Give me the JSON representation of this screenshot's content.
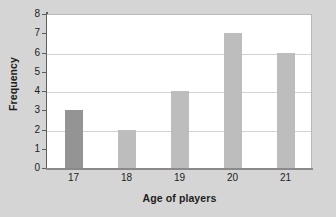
{
  "chart_data": {
    "type": "bar",
    "title": "",
    "subtitle": "",
    "categories": [
      "17",
      "18",
      "19",
      "20",
      "21"
    ],
    "values": [
      3,
      2,
      4,
      7,
      6
    ],
    "xlabel": "Age of players",
    "ylabel": "Frequency",
    "ylim": [
      0,
      8
    ],
    "y_ticks": [
      "0",
      "1",
      "2",
      "3",
      "4",
      "5",
      "6",
      "7",
      "8"
    ],
    "gridlines_at": [
      2,
      4,
      6
    ],
    "grid": "horizontal-even-values-only",
    "legend": "none",
    "bar_colors": [
      "#949494",
      "#bdbdbd",
      "#bdbdbd",
      "#bdbdbd",
      "#bdbdbd"
    ],
    "highlight_index": 0,
    "annotations": []
  },
  "style": {
    "page_background": "#d5d5d5",
    "plot_background": "#ffffff",
    "gridline_color": "#d2d2d2",
    "axis_color": "#5d5d5d",
    "x_axis_color": "#8a8a8a",
    "text_color": "#1d1d1d",
    "bar_default_color": "#bdbdbd",
    "bar_highlight_color": "#949494"
  }
}
